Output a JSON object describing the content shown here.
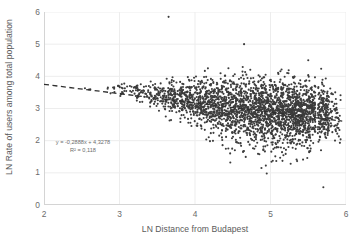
{
  "chart_data": {
    "type": "scatter",
    "title": "",
    "xlabel": "LN Distance from Budapest",
    "ylabel": "LN Rate of users among total population",
    "xlim": [
      2,
      6
    ],
    "ylim": [
      0,
      6
    ],
    "xticks": [
      "2",
      "3",
      "4",
      "5",
      "6"
    ],
    "yticks": [
      "0",
      "1",
      "2",
      "3",
      "4",
      "5",
      "6"
    ],
    "grid": "horizontal-and-vertical-faint",
    "legend": "none",
    "marker_color": "#3c3c3c",
    "marker_size_px": 2.1,
    "trendline": {
      "type": "linear-dashed",
      "slope": -0.2888,
      "intercept": 4.3278,
      "r_squared": 0.118,
      "color": "#2f2f2f",
      "x_start": 2.0,
      "x_end": 5.95,
      "equation_label": "y = -0,2888x + 4,3278",
      "r2_label": "R² = 0,118"
    },
    "series": [
      {
        "name": "Settlements",
        "n_points": 2400,
        "description": "Dense fan-shaped cloud; spread widens as LN distance increases. Mean rate declines from about 3.6 at x=3 to about 2.8 at x=5.7.",
        "notable_points": [
          {
            "x": 3.65,
            "y": 5.85,
            "note": "high outlier"
          },
          {
            "x": 4.65,
            "y": 5.0,
            "note": "high outlier"
          },
          {
            "x": 5.5,
            "y": 4.5,
            "note": "high outlier"
          },
          {
            "x": 5.7,
            "y": 0.55,
            "note": "low outlier"
          },
          {
            "x": 4.95,
            "y": 0.98,
            "note": "low outlier"
          },
          {
            "x": 4.88,
            "y": 1.15,
            "note": "low outlier"
          }
        ],
        "density_bands": [
          {
            "x_center": 2.6,
            "y_center": 3.6,
            "y_sd": 0.06,
            "weight": 3
          },
          {
            "x_center": 2.9,
            "y_center": 3.62,
            "y_sd": 0.08,
            "weight": 10
          },
          {
            "x_center": 3.1,
            "y_center": 3.58,
            "y_sd": 0.1,
            "weight": 22
          },
          {
            "x_center": 3.3,
            "y_center": 3.5,
            "y_sd": 0.14,
            "weight": 40
          },
          {
            "x_center": 3.5,
            "y_center": 3.42,
            "y_sd": 0.2,
            "weight": 70
          },
          {
            "x_center": 3.7,
            "y_center": 3.33,
            "y_sd": 0.26,
            "weight": 110
          },
          {
            "x_center": 3.9,
            "y_center": 3.26,
            "y_sd": 0.32,
            "weight": 150
          },
          {
            "x_center": 4.1,
            "y_center": 3.18,
            "y_sd": 0.38,
            "weight": 185
          },
          {
            "x_center": 4.3,
            "y_center": 3.12,
            "y_sd": 0.42,
            "weight": 210
          },
          {
            "x_center": 4.5,
            "y_center": 3.05,
            "y_sd": 0.46,
            "weight": 235
          },
          {
            "x_center": 4.7,
            "y_center": 3.0,
            "y_sd": 0.5,
            "weight": 265
          },
          {
            "x_center": 4.9,
            "y_center": 2.95,
            "y_sd": 0.52,
            "weight": 295
          },
          {
            "x_center": 5.1,
            "y_center": 2.92,
            "y_sd": 0.52,
            "weight": 320
          },
          {
            "x_center": 5.3,
            "y_center": 2.9,
            "y_sd": 0.5,
            "weight": 330
          },
          {
            "x_center": 5.5,
            "y_center": 2.88,
            "y_sd": 0.47,
            "weight": 300
          },
          {
            "x_center": 5.7,
            "y_center": 2.85,
            "y_sd": 0.42,
            "weight": 180
          },
          {
            "x_center": 5.85,
            "y_center": 2.82,
            "y_sd": 0.34,
            "weight": 60
          }
        ]
      }
    ]
  },
  "axes": {
    "x_title": "LN Distance from Budapest",
    "y_title": "LN Rate of users among total population",
    "x_tick_labels": [
      "2",
      "3",
      "4",
      "5",
      "6"
    ],
    "y_tick_labels": [
      "0",
      "1",
      "2",
      "3",
      "4",
      "5",
      "6"
    ]
  },
  "annotation": {
    "equation": "y = -0,2888x + 4,3278",
    "r_squared": "R² = 0,118"
  },
  "colors": {
    "marker": "#3c3c3c",
    "trendline": "#2f2f2f",
    "grid": "#ededed",
    "axis": "#d4d4d4",
    "tick_text": "#6b6b6b",
    "title_text": "#5a5a5a",
    "annotation_text": "#6d6d6d",
    "background": "#ffffff"
  }
}
